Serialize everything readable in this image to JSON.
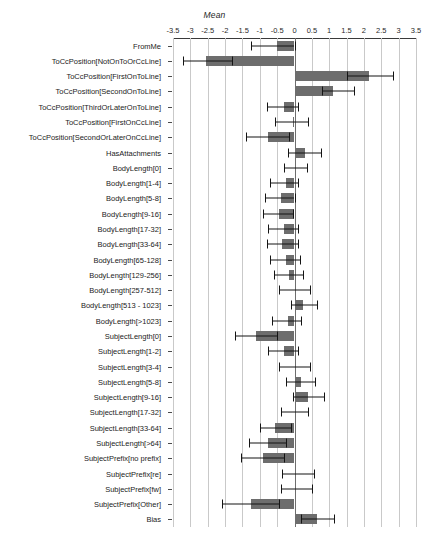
{
  "chart_data": {
    "type": "bar",
    "orientation": "horizontal",
    "title": "Mean",
    "xlabel": "Mean",
    "ylabel": "",
    "xlim": [
      -3.5,
      3.5
    ],
    "grid": true,
    "legend": null,
    "error_bars": "horizontal whiskers with end caps",
    "xticks": [
      -3.5,
      -3,
      -2.5,
      -2,
      -1.5,
      -1,
      -0.5,
      0,
      0.5,
      1,
      1.5,
      2,
      2.5,
      3,
      3.5
    ],
    "xticklabels": [
      "-3.5",
      "-3",
      "-2.5",
      "-2",
      "-1.5",
      "-1",
      "-0.5",
      "0",
      "0.5",
      "1",
      "1.5",
      "2",
      "2.5",
      "3",
      "3.5"
    ],
    "categories": [
      "FromMe",
      "ToCcPosition[NotOnToOrCcLine]",
      "ToCcPosition[FirstOnToLine]",
      "ToCcPosition[SecondOnToLine]",
      "ToCcPosition[ThirdOrLaterOnToLine]",
      "ToCcPosition[FirstOnCcLine]",
      "ToCcPosition[SecondOrLaterOnCcLine]",
      "HasAttachments",
      "BodyLength[0]",
      "BodyLength[1-4]",
      "BodyLength[5-8]",
      "BodyLength[9-16]",
      "BodyLength[17-32]",
      "BodyLength[33-64]",
      "BodyLength[65-128]",
      "BodyLength[129-256]",
      "BodyLength[257-512]",
      "BodyLength[513  - 1023]",
      "BodyLength[>1023]",
      "SubjectLength[0]",
      "SubjectLength[1-2]",
      "SubjectLength[3-4]",
      "SubjectLength[5-8]",
      "SubjectLength[9-16]",
      "SubjectLength[17-32]",
      "SubjectLength[33-64]",
      "SubjectLength[>64]",
      "SubjectPrefix[no prefix]",
      "SubjectPrefix[re]",
      "SubjectPrefix[fw]",
      "SubjectPrefix[Other]",
      "Bias"
    ],
    "values": [
      -0.5,
      -2.55,
      2.15,
      1.1,
      -0.3,
      -0.05,
      -0.75,
      0.3,
      0.05,
      -0.25,
      -0.4,
      -0.45,
      -0.3,
      -0.35,
      -0.25,
      -0.15,
      0.0,
      0.25,
      -0.2,
      -1.1,
      -0.3,
      0.0,
      0.2,
      0.4,
      0.0,
      -0.55,
      -0.75,
      -0.9,
      0.05,
      0.02,
      -1.25,
      0.65
    ],
    "err_low": [
      -1.25,
      -3.2,
      1.5,
      0.8,
      -0.8,
      -0.55,
      -1.4,
      -0.2,
      -0.3,
      -0.7,
      -0.85,
      -0.9,
      -0.75,
      -0.8,
      -0.7,
      -0.6,
      -0.45,
      -0.1,
      -0.65,
      -1.7,
      -0.75,
      -0.45,
      -0.25,
      -0.05,
      -0.4,
      -1.0,
      -1.3,
      -1.55,
      -0.35,
      -0.4,
      -2.1,
      0.2
    ],
    "err_high": [
      0.0,
      -1.8,
      2.85,
      1.7,
      0.1,
      0.4,
      -0.15,
      0.75,
      0.35,
      0.1,
      0.0,
      -0.05,
      0.1,
      0.1,
      0.15,
      0.25,
      0.45,
      0.65,
      0.2,
      -0.5,
      0.1,
      0.45,
      0.6,
      0.85,
      0.4,
      -0.1,
      -0.25,
      -0.3,
      0.55,
      0.5,
      -0.45,
      1.15
    ],
    "colors": {
      "bar": "#6d6d6d",
      "error": "#141414",
      "grid": "#c9c9c9",
      "zero_line": "#6e6e6e",
      "axis": "#3a3a3a",
      "text": "#1c1c1c",
      "background": "#ffffff"
    }
  }
}
